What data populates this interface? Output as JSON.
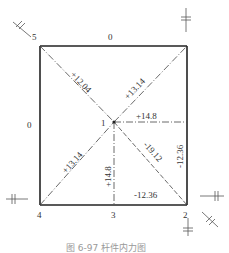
{
  "diagram": {
    "type": "truss-internal-force",
    "nodes": [
      {
        "id": "1",
        "label": "1"
      },
      {
        "id": "2",
        "label": "2"
      },
      {
        "id": "3",
        "label": "3"
      },
      {
        "id": "4",
        "label": "4"
      },
      {
        "id": "5",
        "label": "5"
      }
    ],
    "members": {
      "top": "0",
      "left": "0",
      "diag_5_1": "+12.04",
      "diag_1_topright": "+13.14",
      "horiz_1_right": "+14.8",
      "diag_4_1": "+13.14",
      "vert_1_3": "+14.8",
      "diag_1_2": "-19.12",
      "right": "-12.36",
      "bottom_3_2": "-12.36"
    },
    "caption": "图 6-97  杆件内力图"
  }
}
